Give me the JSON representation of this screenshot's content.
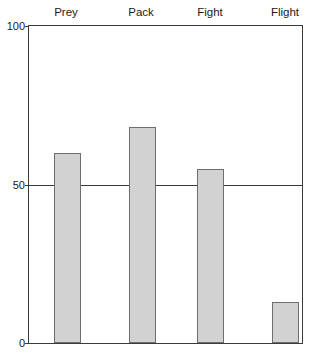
{
  "chart_data": {
    "type": "bar",
    "title": "",
    "subtitle": "",
    "xlabel": "",
    "ylabel": "",
    "categories": [
      "Prey",
      "Pack",
      "Fight",
      "Flight"
    ],
    "values": [
      60,
      68,
      55,
      13
    ],
    "series": [
      {
        "name": "",
        "values": [
          60,
          68,
          55,
          13
        ]
      }
    ],
    "ylim": [
      0,
      100
    ],
    "yticks": [
      0,
      50,
      100
    ],
    "ytick_labels": [
      "0",
      "50",
      "100"
    ],
    "grid": true,
    "gridlines_at": [
      50
    ],
    "legend": false,
    "legend_position": "none",
    "category_labels_position": "top",
    "annotations": [],
    "colors": {
      "bar_fill": "#d2d2d2",
      "bar_stroke": "#6e6e6e",
      "axis": "#3a3a3a",
      "text": "#1a1a1a",
      "background": "#ffffff"
    }
  }
}
